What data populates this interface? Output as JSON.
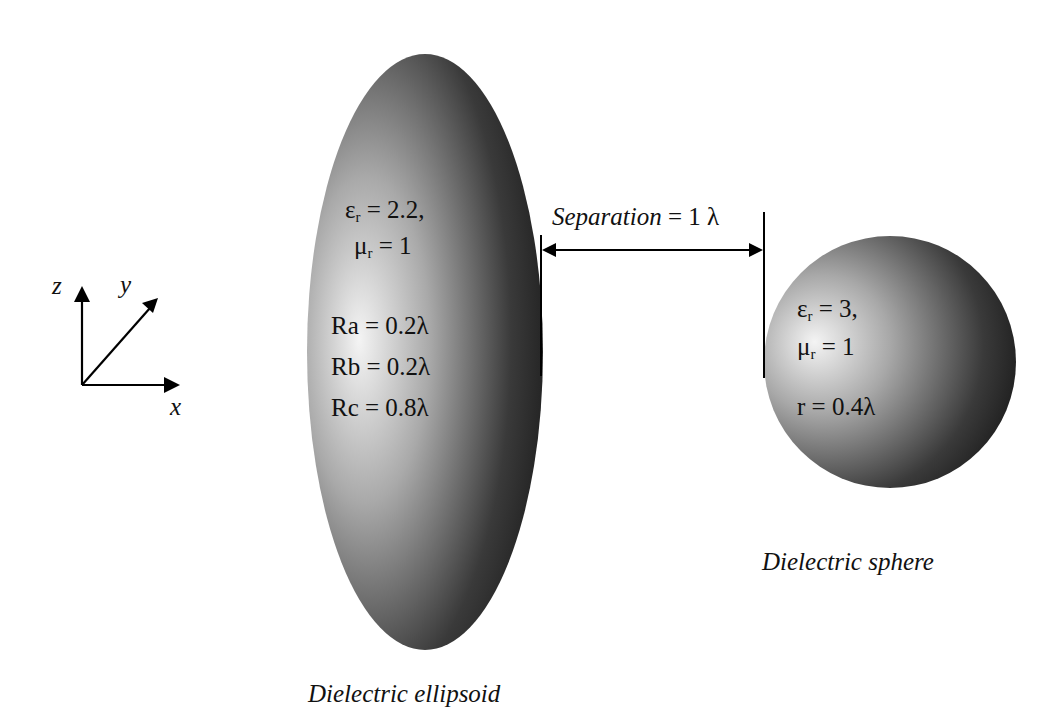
{
  "axes": {
    "z_label": "z",
    "y_label": "y",
    "x_label": "x"
  },
  "ellipsoid": {
    "eps_symbol": "ε",
    "eps_sub": "r",
    "eps_value": " = 2.2,",
    "mu_symbol": "μ",
    "mu_sub": "r",
    "mu_value": " = 1",
    "ra": "Ra = 0.2λ",
    "rb": "Rb = 0.2λ",
    "rc": "Rc = 0.8λ",
    "caption": "Dielectric ellipsoid"
  },
  "separation": {
    "label_italic": "Separation",
    "label_value": " = 1 λ"
  },
  "sphere": {
    "eps_symbol": "ε",
    "eps_sub": "r",
    "eps_value": " = 3,",
    "mu_symbol": "μ",
    "mu_sub": "r",
    "mu_value": " = 1",
    "radius": "r = 0.4λ",
    "caption": "Dielectric sphere"
  },
  "colors": {
    "shape_light": "#f2f2f2",
    "shape_mid": "#9a9a9a",
    "shape_dark": "#1e1e1e",
    "line": "#000000"
  }
}
